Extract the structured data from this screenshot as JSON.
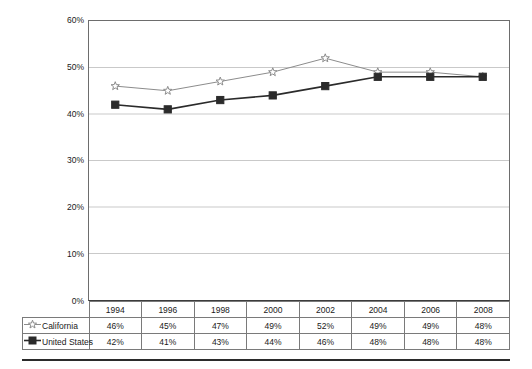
{
  "chart_data": {
    "type": "line",
    "title": "",
    "subtitle": "",
    "xlabel": "",
    "ylabel": "",
    "categories": [
      "1994",
      "1996",
      "1998",
      "2000",
      "2002",
      "2004",
      "2006",
      "2008"
    ],
    "series": [
      {
        "name": "California",
        "marker": "open-star",
        "color": "#8c8c8c",
        "values": [
          46,
          45,
          47,
          49,
          52,
          49,
          49,
          48
        ],
        "labels": [
          "46%",
          "45%",
          "47%",
          "49%",
          "52%",
          "49%",
          "49%",
          "48%"
        ]
      },
      {
        "name": "United States",
        "marker": "filled-square",
        "color": "#2b2b2b",
        "values": [
          42,
          41,
          43,
          44,
          46,
          48,
          48,
          48
        ],
        "labels": [
          "42%",
          "41%",
          "43%",
          "44%",
          "46%",
          "48%",
          "48%",
          "48%"
        ]
      }
    ],
    "ylim": [
      0,
      60
    ],
    "ytick_values": [
      0,
      10,
      20,
      30,
      40,
      50,
      60
    ],
    "ytick_labels": [
      "0%",
      "10%",
      "20%",
      "30%",
      "40%",
      "50%",
      "60%"
    ],
    "grid": true,
    "grid_axis": "y",
    "legend_position": "data-table-row-header",
    "units": "percent",
    "value_suffix": "%"
  },
  "axis": {
    "y_labels": [
      "60%",
      "50%",
      "40%",
      "30%",
      "20%",
      "10%",
      "0%"
    ]
  },
  "table": {
    "header_row": [
      "1994",
      "1996",
      "1998",
      "2000",
      "2002",
      "2004",
      "2006",
      "2008"
    ],
    "rows": [
      {
        "label": "California",
        "marker": "open-star-marker-icon",
        "values": [
          "46%",
          "45%",
          "47%",
          "49%",
          "52%",
          "49%",
          "49%",
          "48%"
        ]
      },
      {
        "label": "United States",
        "marker": "filled-square-marker-icon",
        "values": [
          "42%",
          "41%",
          "43%",
          "44%",
          "46%",
          "48%",
          "48%",
          "48%"
        ]
      }
    ]
  },
  "colors": {
    "california_line": "#8c8c8c",
    "united_states_line": "#2b2b2b",
    "gridline": "#c9c9c9",
    "axis": "#6d6d6d",
    "table_border": "#7a7a7a",
    "rule": "#2b2b2b",
    "background": "#ffffff"
  }
}
